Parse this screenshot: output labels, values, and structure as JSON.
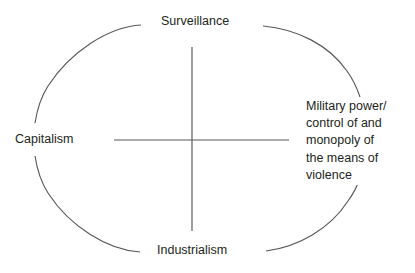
{
  "figure": {
    "background_color": "#ffffff",
    "stroke_color": "#58585b",
    "text_color": "#231f20"
  },
  "diagram": {
    "type": "quadrant-ellipse",
    "labels": {
      "top": "Surveillance",
      "left": "Capitalism",
      "bottom": "Industrialism",
      "right_lines": [
        "Military power/",
        "control of and",
        "monopoly of",
        "the means of",
        "violence"
      ]
    },
    "geometry": {
      "ellipse_center_x": 192,
      "ellipse_center_y": 139,
      "ellipse_radius_x": 155,
      "ellipse_radius_y": 115,
      "cross_horizontal_x1": 114,
      "cross_horizontal_x2": 289,
      "cross_horizontal_y": 140,
      "cross_vertical_y1": 47,
      "cross_vertical_y2": 231,
      "cross_vertical_x": 192
    }
  }
}
